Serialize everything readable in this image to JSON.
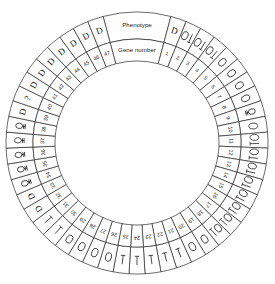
{
  "figure": {
    "title": "",
    "type": "circular-gene-phenotype-wheel",
    "outer_ring_label": "Phenotype",
    "inner_ring_label": "Gene number",
    "total_genes": 47,
    "header_sector_span_degrees": 30,
    "geometry": {
      "center_x": 137,
      "center_y": 143,
      "outer_radius": 131,
      "mid_radius": 104,
      "inner_radius": 82,
      "start_angle_deg": -75,
      "end_angle_deg": 285
    },
    "colors": {
      "stroke": "#2b2b2b",
      "text": "#1a1a1a",
      "background": "#ffffff",
      "cell_fill": "#ffffff"
    }
  },
  "legend": {
    "symbol_names": {
      "D": "letter-D",
      "Q": "circle-with-bar",
      "O": "oval",
      "OL": "oval-plus-vertical-line",
      "L": "vertical-line-with-base",
      "?": "question-mark"
    }
  },
  "chart_data": {
    "type": "table",
    "columns": [
      "Gene number",
      "Phenotype"
    ],
    "rows": [
      {
        "gene": "1",
        "phenotype": "D"
      },
      {
        "gene": "2",
        "phenotype": "OL"
      },
      {
        "gene": "3",
        "phenotype": "OL"
      },
      {
        "gene": "4",
        "phenotype": "OL"
      },
      {
        "gene": "5",
        "phenotype": "O"
      },
      {
        "gene": "6",
        "phenotype": "O"
      },
      {
        "gene": "7",
        "phenotype": "O"
      },
      {
        "gene": "8",
        "phenotype": "O"
      },
      {
        "gene": "9",
        "phenotype": "Q"
      },
      {
        "gene": "10",
        "phenotype": "O"
      },
      {
        "gene": "11",
        "phenotype": "OL"
      },
      {
        "gene": "12",
        "phenotype": "OL"
      },
      {
        "gene": "13",
        "phenotype": "OL"
      },
      {
        "gene": "14",
        "phenotype": "OL"
      },
      {
        "gene": "15",
        "phenotype": "OL"
      },
      {
        "gene": "16",
        "phenotype": "OL"
      },
      {
        "gene": "17",
        "phenotype": "OL"
      },
      {
        "gene": "18",
        "phenotype": "OL"
      },
      {
        "gene": "19",
        "phenotype": "O"
      },
      {
        "gene": "20",
        "phenotype": "O"
      },
      {
        "gene": "21",
        "phenotype": "L"
      },
      {
        "gene": "22",
        "phenotype": "L"
      },
      {
        "gene": "23",
        "phenotype": "L"
      },
      {
        "gene": "24",
        "phenotype": "L"
      },
      {
        "gene": "25",
        "phenotype": "L"
      },
      {
        "gene": "26",
        "phenotype": "O"
      },
      {
        "gene": "27",
        "phenotype": "O"
      },
      {
        "gene": "28",
        "phenotype": "O"
      },
      {
        "gene": "29",
        "phenotype": "O"
      },
      {
        "gene": "30",
        "phenotype": "L"
      },
      {
        "gene": "31",
        "phenotype": "L"
      },
      {
        "gene": "32",
        "phenotype": "D"
      },
      {
        "gene": "33",
        "phenotype": "D"
      },
      {
        "gene": "34",
        "phenotype": "Q"
      },
      {
        "gene": "35",
        "phenotype": "Q"
      },
      {
        "gene": "36",
        "phenotype": "Q"
      },
      {
        "gene": "37",
        "phenotype": "Q"
      },
      {
        "gene": "38",
        "phenotype": "Q"
      },
      {
        "gene": "39",
        "phenotype": "D"
      },
      {
        "gene": "40",
        "phenotype": "?"
      },
      {
        "gene": "41",
        "phenotype": "D"
      },
      {
        "gene": "42",
        "phenotype": "D"
      },
      {
        "gene": "43",
        "phenotype": "D"
      },
      {
        "gene": "44",
        "phenotype": "D"
      },
      {
        "gene": "45",
        "phenotype": "D"
      },
      {
        "gene": "46",
        "phenotype": "D"
      },
      {
        "gene": "47",
        "phenotype": "D"
      }
    ]
  }
}
